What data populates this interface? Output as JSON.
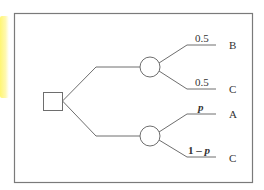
{
  "diagram": {
    "type": "decision-tree",
    "colors": {
      "line": "#6e6e6e",
      "frame": "#7a7a7a",
      "text": "#333333",
      "highlight": "#fff45a"
    },
    "decision_node": {
      "shape": "square"
    },
    "chance_nodes": [
      {
        "id": "upper",
        "branches": [
          {
            "probability": "0.5",
            "outcome": "B"
          },
          {
            "probability": "0.5",
            "outcome": "C"
          }
        ]
      },
      {
        "id": "lower",
        "branches": [
          {
            "probability": "p",
            "outcome": "A"
          },
          {
            "probability_prefix": "1 – ",
            "probability_var": "p",
            "outcome": "C"
          }
        ]
      }
    ]
  }
}
